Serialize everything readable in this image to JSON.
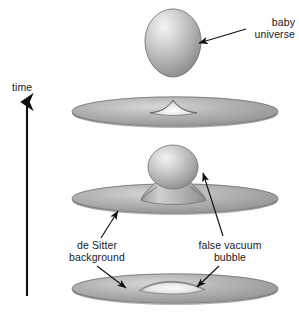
{
  "figure": {
    "background_color": "#ffffff",
    "ink_color": "#1a1a1a",
    "surface_color": "#9a9a9a",
    "highlight_color": "#efefef",
    "shadow_color": "#6e6e6e"
  },
  "axis": {
    "label": "time",
    "direction": "up",
    "arrow": {
      "x": 27,
      "y_tail": 296,
      "y_head": 100
    }
  },
  "labels": {
    "baby_universe": "baby\nuniverse",
    "de_sitter_background": "de Sitter\nbackground",
    "false_vacuum_bubble": "false vacuum\nbubble"
  },
  "leader_lines": [
    {
      "name": "baby-universe-arrow",
      "from": [
        246,
        30
      ],
      "to": [
        197,
        43
      ],
      "arrowhead": "to"
    },
    {
      "name": "de-sitter-upper-arrow",
      "from": [
        100,
        238
      ],
      "to": [
        118,
        210
      ],
      "arrowhead": "to"
    },
    {
      "name": "de-sitter-lower-arrow",
      "from": [
        97,
        266
      ],
      "to": [
        127,
        289
      ],
      "arrowhead": "to"
    },
    {
      "name": "false-vacuum-upper-arrow",
      "from": [
        222,
        236
      ],
      "to": [
        202,
        172
      ],
      "arrowhead": "to"
    },
    {
      "name": "false-vacuum-lower-arrow",
      "from": [
        218,
        266
      ],
      "to": [
        196,
        288
      ],
      "arrowhead": "to"
    }
  ],
  "stages": [
    {
      "name": "baby-universe-detached",
      "order": 4,
      "time_rank": "latest",
      "shape": "egg",
      "center": [
        173,
        45
      ],
      "width": 56,
      "height": 72,
      "description": "detached closed baby universe"
    },
    {
      "name": "pinch-off-disc",
      "order": 3,
      "shape": "disc-with-peak",
      "center": [
        175,
        113
      ],
      "width": 206,
      "height": 30,
      "description": "de Sitter disc after the neck pinches off, leaving a small cusp"
    },
    {
      "name": "neck-and-bulb-disc",
      "order": 2,
      "shape": "disc-with-neck-and-bulb",
      "center": [
        175,
        200
      ],
      "width": 206,
      "height": 30,
      "bulb_center": [
        172,
        168
      ],
      "bulb_width": 50,
      "bulb_height": 44,
      "description": "bubble inflates into a bulb connected by a narrow wormhole neck"
    },
    {
      "name": "bubble-disc",
      "order": 1,
      "time_rank": "earliest",
      "shape": "disc-with-lens-bump",
      "center": [
        175,
        290
      ],
      "width": 206,
      "height": 30,
      "description": "small false vacuum bubble nucleates in the de Sitter background"
    }
  ]
}
